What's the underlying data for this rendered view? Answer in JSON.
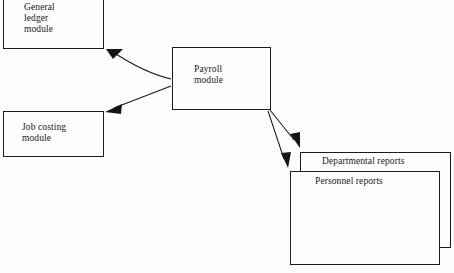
{
  "diagram": {
    "background_color": "#fdfdfc",
    "line_color": "#1b1b1b",
    "text_color": "#171717",
    "nodes": [
      {
        "id": "general_ledger",
        "label": "General\nledger\nmodule",
        "shape": "rectangle"
      },
      {
        "id": "job_costing",
        "label": "Job costing\nmodule",
        "shape": "rectangle"
      },
      {
        "id": "payroll",
        "label": "Payroll\nmodule",
        "shape": "rectangle"
      },
      {
        "id": "departmental_reports",
        "label": "Departmental reports",
        "shape": "rectangle"
      },
      {
        "id": "personnel_reports",
        "label": "Personnel reports",
        "shape": "rectangle"
      }
    ],
    "edges": [
      {
        "from": "payroll",
        "to": "general_ledger",
        "arrow": "single"
      },
      {
        "from": "payroll",
        "to": "job_costing",
        "arrow": "single"
      },
      {
        "from": "payroll",
        "to": "departmental_reports",
        "arrow": "single"
      },
      {
        "from": "payroll",
        "to": "personnel_reports",
        "arrow": "single"
      }
    ]
  }
}
